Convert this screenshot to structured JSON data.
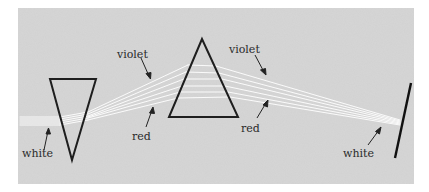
{
  "diagram": {
    "background_color": "#d8d8d8",
    "line_color": "#1e1e1e",
    "beam_color": "#ffffff",
    "labels": {
      "white_left": "white",
      "violet_left": "violet",
      "red_left": "red",
      "violet_right": "violet",
      "red_right": "red",
      "white_right": "white"
    },
    "elements": [
      {
        "name": "inverted-prism",
        "shape": "triangle",
        "points": [
          [
            50,
            79
          ],
          [
            96,
            79
          ],
          [
            72,
            160
          ]
        ]
      },
      {
        "name": "upright-prism",
        "shape": "triangle",
        "points": [
          [
            202,
            39
          ],
          [
            169,
            117
          ],
          [
            238,
            117
          ]
        ]
      },
      {
        "name": "screen",
        "shape": "line",
        "points": [
          [
            411,
            83
          ],
          [
            395,
            158
          ]
        ]
      }
    ]
  }
}
